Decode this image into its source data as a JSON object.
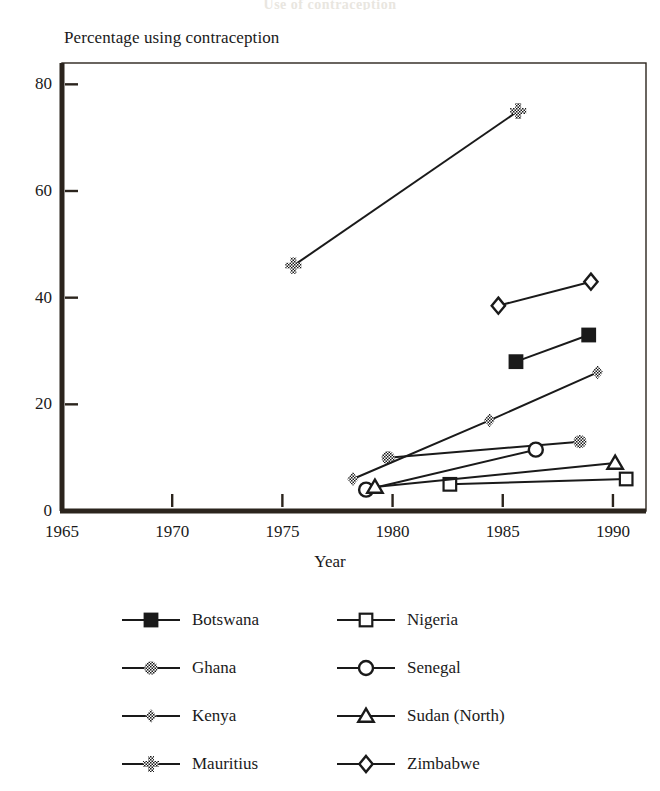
{
  "page": {
    "cut_title": "Use of contraception"
  },
  "chart_data": {
    "type": "line",
    "title": "",
    "xlabel": "Year",
    "ylabel": "Percentage using contraception",
    "xlim": [
      1965,
      1991.5
    ],
    "ylim": [
      0,
      84
    ],
    "xticks": [
      1965,
      1970,
      1975,
      1980,
      1985,
      1990
    ],
    "xtick_labels": [
      "1965",
      "1970",
      "1975",
      "1980",
      "1985",
      "1990"
    ],
    "yticks": [
      0,
      20,
      40,
      60,
      80
    ],
    "ytick_labels": [
      "0",
      "20",
      "40",
      "60",
      "80"
    ],
    "grid": false,
    "legend_position": "below",
    "series": [
      {
        "name": "Botswana",
        "marker": "filled-square",
        "x": [
          1985.6,
          1988.9
        ],
        "y": [
          28,
          33
        ]
      },
      {
        "name": "Ghana",
        "marker": "checkered-circle",
        "x": [
          1979.8,
          1988.5
        ],
        "y": [
          10,
          13
        ]
      },
      {
        "name": "Kenya",
        "marker": "checkered-diamond",
        "x": [
          1978.2,
          1984.4,
          1989.3
        ],
        "y": [
          6,
          17,
          26
        ]
      },
      {
        "name": "Mauritius",
        "marker": "checkered-cross",
        "x": [
          1975.5,
          1985.7
        ],
        "y": [
          46,
          75
        ]
      },
      {
        "name": "Nigeria",
        "marker": "open-square",
        "x": [
          1982.6,
          1990.6
        ],
        "y": [
          5,
          6
        ]
      },
      {
        "name": "Senegal",
        "marker": "open-circle",
        "x": [
          1978.8,
          1986.5
        ],
        "y": [
          4,
          11.5
        ]
      },
      {
        "name": "Sudan (North)",
        "marker": "open-triangle",
        "x": [
          1979.2,
          1990.1
        ],
        "y": [
          4.5,
          9
        ]
      },
      {
        "name": "Zimbabwe",
        "marker": "open-diamond",
        "x": [
          1984.8,
          1989.0
        ],
        "y": [
          38.5,
          43
        ]
      }
    ]
  },
  "legend": {
    "column_order": [
      "Botswana",
      "Nigeria",
      "Ghana",
      "Senegal",
      "Kenya",
      "Sudan (North)",
      "Mauritius",
      "Zimbabwe"
    ]
  },
  "colors": {
    "ink": "#1a1a1a",
    "background": "#ffffff",
    "axis": "#2b241d"
  }
}
